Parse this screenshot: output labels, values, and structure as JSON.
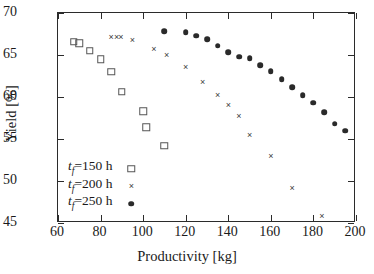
{
  "chart_data": {
    "type": "scatter",
    "title": "",
    "xlabel": "Productivity [kg]",
    "ylabel": "Yield [%]",
    "xlim": [
      60,
      200
    ],
    "ylim": [
      45,
      70
    ],
    "xticks": [
      60,
      80,
      100,
      120,
      140,
      160,
      180,
      200
    ],
    "yticks": [
      45,
      50,
      55,
      60,
      65,
      70
    ],
    "grid": false,
    "legend_position": "lower-left-inside",
    "series": [
      {
        "name": "t_f =150 h",
        "label_prefix": "t",
        "label_sub": "f",
        "label_suffix": "=150 h",
        "marker": "open-square",
        "color": "#555555",
        "points": [
          [
            67.5,
            66.6
          ],
          [
            70.0,
            66.4
          ],
          [
            75.0,
            65.5
          ],
          [
            80.0,
            64.5
          ],
          [
            85.0,
            63.0
          ],
          [
            90.0,
            60.6
          ],
          [
            100.0,
            58.3
          ],
          [
            101.5,
            56.4
          ],
          [
            110.0,
            54.2
          ]
        ]
      },
      {
        "name": "t_f =200 h",
        "label_prefix": "t",
        "label_sub": "f",
        "label_suffix": "=200 h",
        "marker": "cross",
        "color": "#3a3a3a",
        "points": [
          [
            85.0,
            67.2
          ],
          [
            87.5,
            67.2
          ],
          [
            89.5,
            67.1
          ],
          [
            95.0,
            66.8
          ],
          [
            105.0,
            65.7
          ],
          [
            111.0,
            65.0
          ],
          [
            120.0,
            63.6
          ],
          [
            128.0,
            61.8
          ],
          [
            135.0,
            60.2
          ],
          [
            140.0,
            59.0
          ],
          [
            145.0,
            57.7
          ],
          [
            150.0,
            55.5
          ],
          [
            160.0,
            53.0
          ],
          [
            170.0,
            49.2
          ],
          [
            184.0,
            45.8
          ]
        ]
      },
      {
        "name": "t_f =250 h",
        "label_prefix": "t",
        "label_sub": "f",
        "label_suffix": "=250 h",
        "marker": "filled-circle",
        "color": "#2a2a2a",
        "points": [
          [
            110.0,
            67.8
          ],
          [
            120.0,
            67.7
          ],
          [
            125.0,
            67.3
          ],
          [
            130.0,
            66.9
          ],
          [
            135.0,
            66.1
          ],
          [
            140.0,
            65.3
          ],
          [
            145.0,
            64.8
          ],
          [
            150.0,
            64.6
          ],
          [
            155.0,
            63.8
          ],
          [
            160.0,
            63.1
          ],
          [
            165.0,
            62.1
          ],
          [
            170.0,
            61.2
          ],
          [
            175.0,
            60.2
          ],
          [
            180.0,
            59.3
          ],
          [
            185.0,
            58.2
          ],
          [
            190.0,
            56.8
          ],
          [
            195.0,
            56.0
          ]
        ]
      }
    ]
  }
}
